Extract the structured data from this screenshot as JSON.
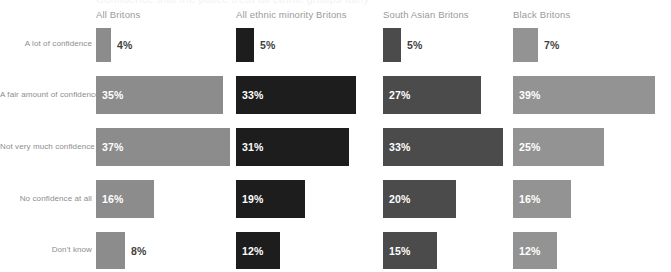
{
  "title_strip": {
    "text": "Confidence that the police treat all ethnic groups fairly"
  },
  "columns": [
    {
      "label": "All Britons",
      "color": "#8c8c8c",
      "x": 96,
      "header_x": 96
    },
    {
      "label": "All ethnic minority Britons",
      "color": "#1d1d1d",
      "x": 236,
      "header_x": 236
    },
    {
      "label": "South Asian Britons",
      "color": "#4b4b4b",
      "x": 383,
      "header_x": 383
    },
    {
      "label": "Black Britons",
      "color": "#939393",
      "x": 513,
      "header_x": 513
    }
  ],
  "rows": [
    {
      "label": "A lot of confidence",
      "y": 28,
      "height": 34,
      "label_y": 39
    },
    {
      "label": "A fair amount of confidence",
      "y": 76,
      "height": 38,
      "label_y": 90
    },
    {
      "label": "Not very much confidence",
      "y": 128,
      "height": 38,
      "label_y": 142
    },
    {
      "label": "No confidence at all",
      "y": 180,
      "height": 38,
      "label_y": 194
    },
    {
      "label": "Don't know",
      "y": 232,
      "height": 37,
      "label_y": 245
    }
  ],
  "chart_data": {
    "type": "bar",
    "title": "Confidence that the police treat all ethnic groups fairly",
    "xlabel": "",
    "ylabel": "",
    "orientation": "horizontal",
    "grid": false,
    "legend": "column-headers-top",
    "value_suffix": "%",
    "categories": [
      "A lot of confidence",
      "A fair amount of confidence",
      "Not very much confidence",
      "No confidence at all",
      "Don't know"
    ],
    "series": [
      {
        "name": "All Britons",
        "color": "#8c8c8c",
        "values": [
          4,
          35,
          37,
          16,
          8
        ]
      },
      {
        "name": "All ethnic minority Britons",
        "color": "#1d1d1d",
        "values": [
          5,
          33,
          31,
          19,
          12
        ]
      },
      {
        "name": "South Asian Britons",
        "color": "#4b4b4b",
        "values": [
          5,
          27,
          33,
          20,
          15
        ]
      },
      {
        "name": "Black Britons",
        "color": "#939393",
        "values": [
          7,
          39,
          25,
          16,
          12
        ]
      }
    ],
    "value_labels": [
      [
        "4%",
        "35%",
        "37%",
        "16%",
        "8%"
      ],
      [
        "5%",
        "33%",
        "31%",
        "19%",
        "12%"
      ],
      [
        "5%",
        "27%",
        "33%",
        "20%",
        "15%"
      ],
      [
        "7%",
        "39%",
        "25%",
        "16%",
        "12%"
      ]
    ],
    "px_per_percent": 3.63,
    "xlim": [
      0,
      40
    ]
  }
}
